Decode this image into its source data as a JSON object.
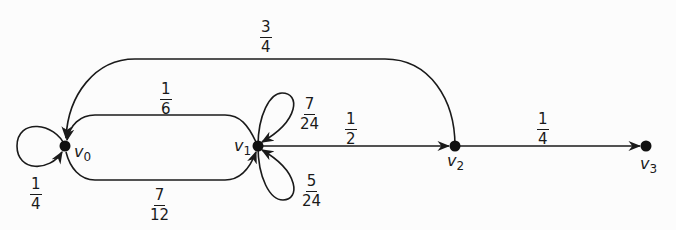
{
  "diagram": {
    "type": "markov-chain-state-diagram",
    "nodes": [
      {
        "id": "v0",
        "label": "v",
        "sub": "0"
      },
      {
        "id": "v1",
        "label": "v",
        "sub": "1"
      },
      {
        "id": "v2",
        "label": "v",
        "sub": "2"
      },
      {
        "id": "v3",
        "label": "v",
        "sub": "3"
      }
    ],
    "edges": [
      {
        "from": "v0",
        "to": "v0",
        "num": "1",
        "den": "4"
      },
      {
        "from": "v0",
        "to": "v1",
        "num": "7",
        "den": "12"
      },
      {
        "from": "v1",
        "to": "v0",
        "num": "1",
        "den": "6"
      },
      {
        "from": "v1",
        "to": "v1",
        "num": "7",
        "den": "24"
      },
      {
        "from": "v1",
        "to": "v1",
        "num": "5",
        "den": "24"
      },
      {
        "from": "v1",
        "to": "v2",
        "num": "1",
        "den": "2"
      },
      {
        "from": "v2",
        "to": "v0",
        "num": "3",
        "den": "4"
      },
      {
        "from": "v2",
        "to": "v3",
        "num": "1",
        "den": "4"
      }
    ],
    "colors": {
      "ink": "#1a1a1a",
      "background": "#fcfcfc"
    }
  }
}
